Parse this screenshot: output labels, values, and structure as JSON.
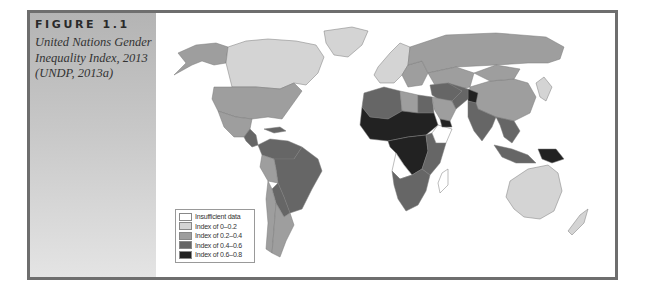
{
  "figure": {
    "label": "FIGURE 1.1",
    "caption": "United Nations Gender Inequality Index, 2013 (UNDP, 2013a)"
  },
  "chart_data": {
    "type": "choropleth",
    "title": "United Nations Gender Inequality Index, 2013 (UNDP, 2013a)",
    "legend_position": "bottom-left",
    "classes": [
      {
        "key": "na",
        "label": "Insufficient data",
        "color": "#ffffff"
      },
      {
        "key": "c1",
        "label": "Index of 0–0.2",
        "color": "#d4d4d4"
      },
      {
        "key": "c2",
        "label": "Index of 0.2–0.4",
        "color": "#9e9e9e"
      },
      {
        "key": "c3",
        "label": "Index of 0.4–0.6",
        "color": "#666666"
      },
      {
        "key": "c4",
        "label": "Index of 0.6–0.8",
        "color": "#222222"
      }
    ],
    "regions": [
      {
        "name": "Alaska/USA",
        "class": "c2"
      },
      {
        "name": "Canada",
        "class": "c1"
      },
      {
        "name": "Greenland",
        "class": "c1"
      },
      {
        "name": "United States",
        "class": "c2"
      },
      {
        "name": "Mexico",
        "class": "c2"
      },
      {
        "name": "Central America",
        "class": "c3"
      },
      {
        "name": "Caribbean",
        "class": "c3"
      },
      {
        "name": "Northern South America",
        "class": "c3"
      },
      {
        "name": "Brazil",
        "class": "c3"
      },
      {
        "name": "Peru",
        "class": "c2"
      },
      {
        "name": "Bolivia/Paraguay",
        "class": "c3"
      },
      {
        "name": "Chile",
        "class": "c2"
      },
      {
        "name": "Argentina",
        "class": "c2"
      },
      {
        "name": "Western Europe",
        "class": "c1"
      },
      {
        "name": "Eastern Europe",
        "class": "c2"
      },
      {
        "name": "Russia",
        "class": "c2"
      },
      {
        "name": "Central Asia",
        "class": "c2"
      },
      {
        "name": "China",
        "class": "c2"
      },
      {
        "name": "Mongolia",
        "class": "c2"
      },
      {
        "name": "Japan/Korea",
        "class": "c1"
      },
      {
        "name": "North Africa (West)",
        "class": "c3"
      },
      {
        "name": "Libya",
        "class": "c2"
      },
      {
        "name": "Egypt",
        "class": "c3"
      },
      {
        "name": "Sahel/West Africa",
        "class": "c4"
      },
      {
        "name": "Central Africa",
        "class": "c4"
      },
      {
        "name": "East Africa",
        "class": "c3"
      },
      {
        "name": "Somalia/Sudan region",
        "class": "na"
      },
      {
        "name": "Angola",
        "class": "na"
      },
      {
        "name": "Southern Africa",
        "class": "c3"
      },
      {
        "name": "Madagascar",
        "class": "na"
      },
      {
        "name": "Middle East",
        "class": "c3"
      },
      {
        "name": "Saudi Arabia",
        "class": "c2"
      },
      {
        "name": "Yemen",
        "class": "c4"
      },
      {
        "name": "Afghanistan",
        "class": "c4"
      },
      {
        "name": "Iran",
        "class": "c3"
      },
      {
        "name": "South Asia",
        "class": "c3"
      },
      {
        "name": "Southeast Asia",
        "class": "c3"
      },
      {
        "name": "Indonesia",
        "class": "c3"
      },
      {
        "name": "Papua New Guinea",
        "class": "c4"
      },
      {
        "name": "Australia",
        "class": "c1"
      },
      {
        "name": "New Zealand",
        "class": "c1"
      }
    ]
  }
}
